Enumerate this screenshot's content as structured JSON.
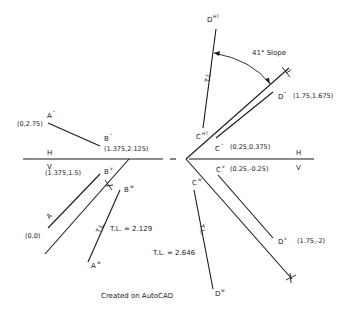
{
  "drawing": {
    "fold_left": {
      "h": "H",
      "v": "V"
    },
    "fold_right": {
      "h": "H",
      "v": "V"
    },
    "line_ab": {
      "a_h": {
        "label": "A",
        "sup": "H",
        "coord": "(0,2.75)"
      },
      "b_h": {
        "label": "B",
        "sup": "H",
        "coord": "(1.375,2.125)"
      },
      "a_v": {
        "label": "A",
        "sup": "V",
        "coord": "(0,0)"
      },
      "b_v": {
        "label": "B",
        "sup": "V",
        "coord": "(1.375,1.5)"
      },
      "a_w": {
        "label": "A",
        "sup": "W"
      },
      "b_w": {
        "label": "B",
        "sup": "W"
      },
      "tl_mark": "T.L.",
      "true_length": "T.L. = 2.129"
    },
    "line_cd": {
      "c_h": {
        "label": "C",
        "sup": "H",
        "coord": "(0.25,0.375)"
      },
      "d_h": {
        "label": "D",
        "sup": "H",
        "coord": "(1.75,1.675)"
      },
      "c_v": {
        "label": "C",
        "sup": "V",
        "coord": "(0.25,-0.25)"
      },
      "d_v": {
        "label": "D",
        "sup": "V",
        "coord": "(1.75,-2)"
      },
      "c_ht": {
        "label": "C",
        "sup": "HT"
      },
      "d_ht": {
        "label": "D",
        "sup": "HT"
      },
      "c_w": {
        "label": "C",
        "sup": "W"
      },
      "d_w": {
        "label": "D",
        "sup": "W"
      },
      "tl_mark_upper": "T.L.",
      "tl_mark_lower": "T.L.",
      "true_length": "T.L. = 2.646",
      "slope": "41° Slope"
    },
    "footer": "Created on AutoCAD"
  },
  "colors": {
    "background": "#ffffff",
    "ink": "#1a1a1a"
  }
}
